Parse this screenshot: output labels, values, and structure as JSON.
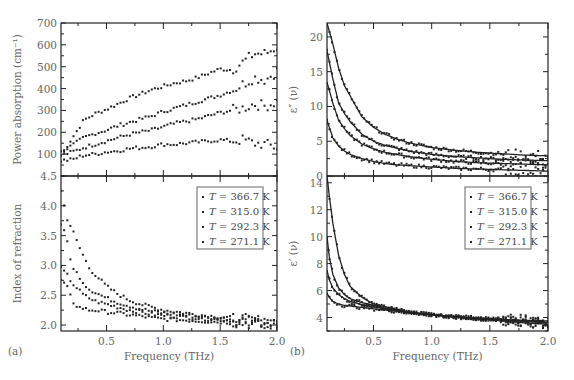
{
  "figure": {
    "panel_a_label": "(a)",
    "panel_b_label": "(b)",
    "legend": [
      {
        "T": "T",
        "text": " = 366.7 K"
      },
      {
        "T": "T",
        "text": " = 315.0 K"
      },
      {
        "T": "T",
        "text": " = 292.3 K"
      },
      {
        "T": "T",
        "text": " = 271.1 K"
      }
    ]
  },
  "chart_data": [
    {
      "id": "a-top",
      "type": "scatter",
      "title": "",
      "xlabel": "",
      "ylabel": "Power absorption (cm⁻¹)",
      "xlim": [
        0.1,
        2.0
      ],
      "ylim": [
        0,
        700
      ],
      "yticks": [
        100,
        200,
        300,
        400,
        500,
        600,
        700
      ],
      "series": [
        {
          "name": "T = 366.7 K",
          "x": [
            0.1,
            0.2,
            0.3,
            0.4,
            0.5,
            0.6,
            0.7,
            0.8,
            0.9,
            1.0,
            1.1,
            1.2,
            1.3,
            1.4,
            1.5,
            1.6,
            1.7,
            1.8,
            1.9,
            2.0
          ],
          "y": [
            95,
            175,
            255,
            285,
            305,
            330,
            355,
            375,
            395,
            410,
            425,
            435,
            450,
            470,
            490,
            485,
            520,
            560,
            560,
            590
          ]
        },
        {
          "name": "T = 315.0 K",
          "x": [
            0.1,
            0.2,
            0.3,
            0.4,
            0.5,
            0.6,
            0.7,
            0.8,
            0.9,
            1.0,
            1.1,
            1.2,
            1.3,
            1.4,
            1.5,
            1.6,
            1.7,
            1.8,
            1.9,
            2.0
          ],
          "y": [
            110,
            140,
            175,
            195,
            210,
            230,
            245,
            260,
            275,
            295,
            310,
            325,
            340,
            355,
            370,
            390,
            420,
            450,
            440,
            480
          ]
        },
        {
          "name": "T = 292.3 K",
          "x": [
            0.1,
            0.2,
            0.3,
            0.4,
            0.5,
            0.6,
            0.7,
            0.8,
            0.9,
            1.0,
            1.1,
            1.2,
            1.3,
            1.4,
            1.5,
            1.6,
            1.7,
            1.8,
            1.9,
            2.0
          ],
          "y": [
            95,
            110,
            130,
            145,
            160,
            175,
            190,
            200,
            210,
            225,
            240,
            250,
            260,
            275,
            290,
            300,
            310,
            330,
            320,
            340
          ]
        },
        {
          "name": "T = 271.1 K",
          "x": [
            0.1,
            0.2,
            0.3,
            0.4,
            0.5,
            0.6,
            0.7,
            0.8,
            0.9,
            1.0,
            1.1,
            1.2,
            1.3,
            1.4,
            1.5,
            1.6,
            1.7,
            1.8,
            1.9,
            2.0
          ],
          "y": [
            70,
            75,
            95,
            100,
            110,
            115,
            125,
            130,
            135,
            145,
            145,
            150,
            155,
            160,
            165,
            160,
            165,
            150,
            145,
            130
          ]
        }
      ]
    },
    {
      "id": "a-bottom",
      "type": "scatter",
      "title": "",
      "xlabel": "Frequency (THz)",
      "ylabel": "Index of refraction",
      "xlim": [
        0.1,
        2.0
      ],
      "ylim": [
        1.9,
        4.5
      ],
      "xticks": [
        0.5,
        1.0,
        1.5,
        2.0
      ],
      "yticks": [
        2.0,
        2.5,
        3.0,
        3.5,
        4.0,
        4.5
      ],
      "series": [
        {
          "name": "T = 366.7 K",
          "x": [
            0.1,
            0.15,
            0.2,
            0.25,
            0.3,
            0.35,
            0.4,
            0.5,
            0.6,
            0.7,
            0.8,
            0.9,
            1.0,
            1.2,
            1.4,
            1.6,
            1.8,
            2.0
          ],
          "y": [
            4.25,
            3.8,
            3.6,
            3.35,
            3.15,
            2.95,
            2.85,
            2.65,
            2.52,
            2.42,
            2.35,
            2.3,
            2.25,
            2.2,
            2.15,
            2.12,
            2.08,
            2.05
          ]
        },
        {
          "name": "T = 315.0 K",
          "x": [
            0.1,
            0.15,
            0.2,
            0.25,
            0.3,
            0.35,
            0.4,
            0.5,
            0.6,
            0.7,
            0.8,
            0.9,
            1.0,
            1.2,
            1.4,
            1.6,
            1.8,
            2.0
          ],
          "y": [
            3.7,
            3.45,
            2.95,
            2.85,
            2.7,
            2.6,
            2.55,
            2.45,
            2.38,
            2.32,
            2.27,
            2.23,
            2.2,
            2.16,
            2.12,
            2.1,
            2.07,
            2.03
          ]
        },
        {
          "name": "T = 292.3 K",
          "x": [
            0.1,
            0.15,
            0.2,
            0.25,
            0.3,
            0.35,
            0.4,
            0.5,
            0.6,
            0.7,
            0.8,
            0.9,
            1.0,
            1.2,
            1.4,
            1.6,
            1.8,
            2.0
          ],
          "y": [
            2.95,
            2.85,
            2.7,
            2.6,
            2.5,
            2.45,
            2.4,
            2.35,
            2.3,
            2.25,
            2.22,
            2.18,
            2.16,
            2.13,
            2.1,
            2.08,
            2.05,
            2.02
          ]
        },
        {
          "name": "T = 271.1 K",
          "x": [
            0.1,
            0.15,
            0.2,
            0.25,
            0.3,
            0.35,
            0.4,
            0.5,
            0.6,
            0.7,
            0.8,
            0.9,
            1.0,
            1.2,
            1.4,
            1.6,
            1.8,
            2.0
          ],
          "y": [
            2.75,
            2.65,
            2.4,
            2.3,
            2.28,
            2.25,
            2.25,
            2.22,
            2.2,
            2.17,
            2.15,
            2.12,
            2.1,
            2.08,
            2.06,
            2.04,
            2.02,
            2.0
          ]
        }
      ]
    },
    {
      "id": "b-top",
      "type": "scatter",
      "title": "",
      "xlabel": "",
      "ylabel": "ε″ (ν)",
      "xlim": [
        0.1,
        2.0
      ],
      "ylim": [
        0,
        22
      ],
      "yticks": [
        0,
        5,
        10,
        15,
        20
      ],
      "series": [
        {
          "name": "T = 366.7 K",
          "x": [
            0.1,
            0.15,
            0.2,
            0.25,
            0.3,
            0.4,
            0.5,
            0.6,
            0.7,
            0.8,
            1.0,
            1.2,
            1.4,
            1.6,
            1.8,
            2.0
          ],
          "y": [
            22,
            19,
            15.5,
            13,
            11.5,
            8.5,
            7,
            6,
            5.3,
            4.8,
            4.1,
            3.7,
            3.4,
            3.2,
            3.0,
            2.9
          ]
        },
        {
          "name": "T = 315.0 K",
          "x": [
            0.1,
            0.15,
            0.2,
            0.25,
            0.3,
            0.4,
            0.5,
            0.6,
            0.7,
            0.8,
            1.0,
            1.2,
            1.4,
            1.6,
            1.8,
            2.0
          ],
          "y": [
            18,
            14,
            10.5,
            9,
            7.8,
            6,
            5,
            4.4,
            4,
            3.6,
            3.1,
            2.8,
            2.6,
            2.4,
            2.3,
            2.2
          ]
        },
        {
          "name": "T = 292.3 K",
          "x": [
            0.1,
            0.15,
            0.2,
            0.25,
            0.3,
            0.4,
            0.5,
            0.6,
            0.7,
            0.8,
            1.0,
            1.2,
            1.4,
            1.6,
            1.8,
            2.0
          ],
          "y": [
            13.5,
            10.5,
            8,
            6.8,
            5.8,
            4.6,
            3.9,
            3.4,
            3.1,
            2.8,
            2.4,
            2.1,
            1.9,
            1.8,
            1.7,
            1.6
          ]
        },
        {
          "name": "T = 271.1 K",
          "x": [
            0.1,
            0.15,
            0.2,
            0.25,
            0.3,
            0.4,
            0.5,
            0.6,
            0.7,
            0.8,
            1.0,
            1.2,
            1.4,
            1.6,
            1.8,
            2.0
          ],
          "y": [
            8,
            5.5,
            4.3,
            3.6,
            3.1,
            2.5,
            2.1,
            1.8,
            1.6,
            1.5,
            1.3,
            1.1,
            1.0,
            0.9,
            0.8,
            0.7
          ]
        }
      ]
    },
    {
      "id": "b-bottom",
      "type": "scatter",
      "title": "",
      "xlabel": "Frequency (THz)",
      "ylabel": "ε′ (ν)",
      "xlim": [
        0.1,
        2.0
      ],
      "ylim": [
        3.0,
        14.5
      ],
      "xticks": [
        0.5,
        1.0,
        1.5,
        2.0
      ],
      "yticks": [
        4,
        6,
        8,
        10,
        12,
        14
      ],
      "series": [
        {
          "name": "T = 366.7 K",
          "x": [
            0.1,
            0.12,
            0.15,
            0.2,
            0.25,
            0.3,
            0.4,
            0.5,
            0.6,
            0.8,
            1.0,
            1.2,
            1.4,
            1.6,
            1.8,
            2.0
          ],
          "y": [
            14.5,
            13,
            11,
            8.6,
            7.2,
            6.3,
            5.5,
            5.0,
            4.8,
            4.4,
            4.2,
            4.05,
            3.95,
            3.85,
            3.8,
            3.75
          ]
        },
        {
          "name": "T = 315.0 K",
          "x": [
            0.1,
            0.12,
            0.15,
            0.2,
            0.25,
            0.3,
            0.4,
            0.5,
            0.6,
            0.8,
            1.0,
            1.2,
            1.4,
            1.6,
            1.8,
            2.0
          ],
          "y": [
            10,
            8.5,
            7.2,
            6.2,
            5.7,
            5.4,
            5.1,
            4.9,
            4.7,
            4.4,
            4.2,
            4.05,
            3.95,
            3.85,
            3.75,
            3.65
          ]
        },
        {
          "name": "T = 292.3 K",
          "x": [
            0.1,
            0.12,
            0.15,
            0.2,
            0.25,
            0.3,
            0.4,
            0.5,
            0.6,
            0.8,
            1.0,
            1.2,
            1.4,
            1.6,
            1.8,
            2.0
          ],
          "y": [
            7.5,
            6.8,
            6.2,
            5.7,
            5.4,
            5.2,
            4.95,
            4.8,
            4.65,
            4.4,
            4.2,
            4.05,
            3.92,
            3.8,
            3.7,
            3.6
          ]
        },
        {
          "name": "T = 271.1 K",
          "x": [
            0.1,
            0.12,
            0.15,
            0.2,
            0.25,
            0.3,
            0.4,
            0.5,
            0.6,
            0.8,
            1.0,
            1.2,
            1.4,
            1.6,
            1.8,
            2.0
          ],
          "y": [
            5.8,
            5.5,
            5.2,
            5.0,
            4.9,
            4.85,
            4.75,
            4.65,
            4.55,
            4.38,
            4.2,
            4.05,
            3.9,
            3.75,
            3.6,
            3.5
          ]
        }
      ]
    }
  ]
}
